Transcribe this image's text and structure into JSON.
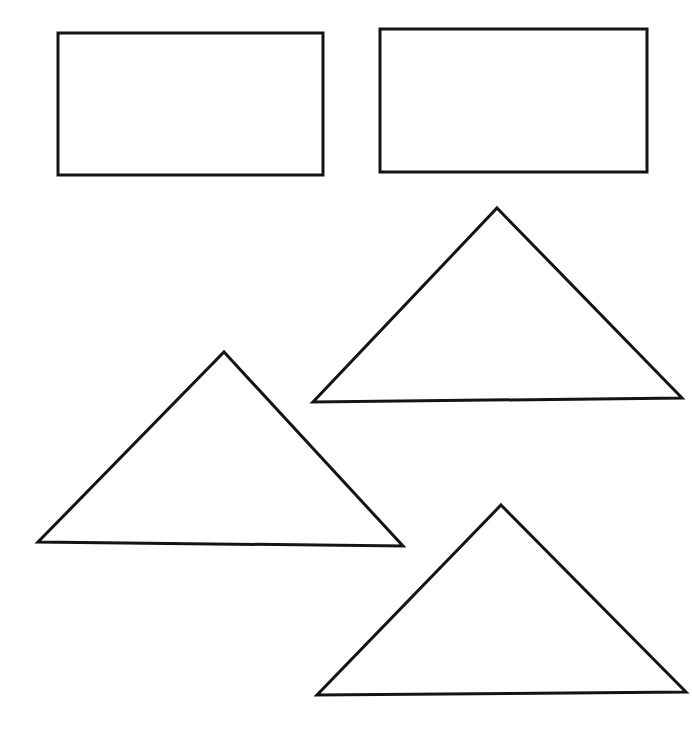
{
  "canvas": {
    "width": 692,
    "height": 743,
    "background": "#ffffff",
    "stroke_color": "#141414",
    "stroke_width": 3
  },
  "shapes": [
    {
      "name": "rectangle-top-left",
      "type": "rect",
      "x": 58,
      "y": 33,
      "width": 265,
      "height": 142
    },
    {
      "name": "rectangle-top-right",
      "type": "rect",
      "x": 380,
      "y": 29,
      "width": 267,
      "height": 143
    },
    {
      "name": "triangle-upper-right",
      "type": "triangle",
      "points": [
        [
          497,
          208
        ],
        [
          682,
          398
        ],
        [
          313,
          402
        ]
      ]
    },
    {
      "name": "triangle-middle-left",
      "type": "triangle",
      "points": [
        [
          224,
          352
        ],
        [
          403,
          546
        ],
        [
          38,
          542
        ]
      ]
    },
    {
      "name": "triangle-lower-right",
      "type": "triangle",
      "points": [
        [
          501,
          505
        ],
        [
          686,
          692
        ],
        [
          317,
          695
        ]
      ]
    }
  ]
}
